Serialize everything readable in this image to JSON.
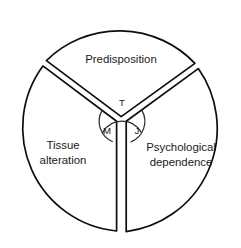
{
  "figure": {
    "type": "venn-like-three-sector-circle-diagram",
    "background_color": "#ffffff",
    "stroke_color": "#0d0d0d"
  },
  "sectors": [
    {
      "id": "predisposition",
      "name": "predisposition-sector",
      "label_line1": "Predisposition",
      "label_line2": "",
      "position": "top"
    },
    {
      "id": "tissue-alteration",
      "name": "tissue-alteration-sector",
      "label_line1": "Tissue",
      "label_line2": "alteration",
      "position": "lower-left"
    },
    {
      "id": "psychological-dependence",
      "name": "psychological-dependence-sector",
      "label_line1": "Psychological",
      "label_line2": "dependence",
      "position": "lower-right"
    }
  ],
  "core": {
    "name": "central-overlap-circle",
    "segments": [
      {
        "id": "t",
        "label": "T",
        "position": "top"
      },
      {
        "id": "m",
        "label": "M",
        "position": "lower-left"
      },
      {
        "id": "j",
        "label": "J",
        "position": "lower-right"
      }
    ]
  }
}
